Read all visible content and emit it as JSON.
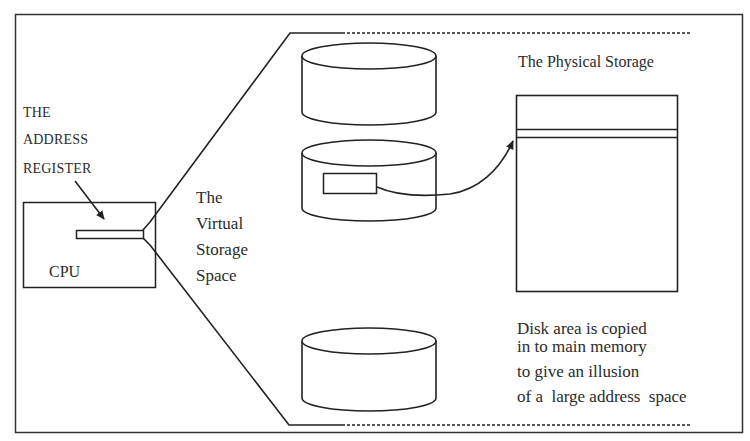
{
  "diagram": {
    "type": "virtual-memory-illustration",
    "labels": {
      "address_register": [
        "THE",
        "ADDRESS",
        "REGISTER"
      ],
      "cpu": "CPU",
      "virtual_storage": [
        "The",
        "Virtual",
        "Storage",
        "Space"
      ],
      "physical_storage": "The Physical Storage",
      "note": [
        "Disk area is copied",
        "in to main memory",
        "to give an illusion",
        "of a  large address  space"
      ]
    },
    "nodes": [
      {
        "id": "cpu",
        "shape": "rectangle",
        "label": "CPU"
      },
      {
        "id": "address-register",
        "shape": "bar",
        "label": "THE ADDRESS REGISTER"
      },
      {
        "id": "disk-1",
        "shape": "cylinder"
      },
      {
        "id": "disk-2",
        "shape": "cylinder",
        "contains": "disk-area-block"
      },
      {
        "id": "disk-3",
        "shape": "cylinder"
      },
      {
        "id": "physical-storage",
        "shape": "rectangle",
        "label": "The Physical Storage"
      }
    ],
    "edges": [
      {
        "from": "address-register",
        "to": "virtual-storage-space",
        "style": "fan-out lines"
      },
      {
        "from": "disk-area-block",
        "to": "physical-storage-page",
        "style": "curved arrow"
      }
    ],
    "colors": {
      "stroke": "#222222",
      "background": "#ffffff",
      "text": "#2b2b2b"
    }
  }
}
